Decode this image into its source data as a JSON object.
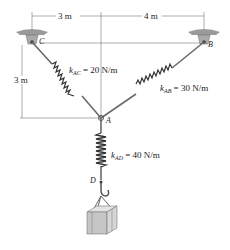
{
  "dimensions": {
    "horizontal_left": "3 m",
    "horizontal_right": "4 m",
    "vertical_left": "3 m"
  },
  "points": {
    "C": "C",
    "B": "B",
    "A": "A",
    "D": "D"
  },
  "springs": {
    "AC": {
      "k": "k",
      "sub": "AC",
      "value": "= 20 N/m"
    },
    "AB": {
      "k": "k",
      "sub": "AB",
      "value": "= 30 N/m"
    },
    "AD": {
      "k": "k",
      "sub": "AD",
      "value": "= 40 N/m"
    }
  },
  "colors": {
    "line": "#555555",
    "spring": "#333333",
    "support": "#888888",
    "crate": "#c8c8c8"
  }
}
